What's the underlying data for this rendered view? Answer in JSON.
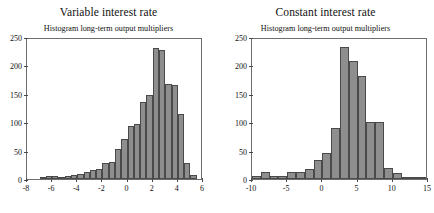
{
  "figure": {
    "width": 434,
    "height": 213,
    "background": "#ffffff",
    "bar_fill": "#8e8e8e",
    "bar_edge": "#4a4a4a",
    "axis_color": "#6e6e6e"
  },
  "panels": [
    {
      "id": "variable-interest-rate",
      "title": "Variable interest rate",
      "subtitle": "Histogram long-term output multipliers"
    },
    {
      "id": "constant-interest-rate",
      "title": "Constant interest rate",
      "subtitle": "Histogram long-term output multipliers"
    }
  ],
  "chart_data": [
    {
      "type": "bar",
      "id": "variable-interest-rate",
      "title": "Variable interest rate",
      "subtitle": "Histogram long-term output multipliers",
      "xlabel": "",
      "ylabel": "",
      "xlim": [
        -8,
        6
      ],
      "ylim": [
        0,
        250
      ],
      "xticks": [
        -8,
        -6,
        -4,
        -2,
        0,
        2,
        4,
        6
      ],
      "yticks": [
        0,
        50,
        100,
        150,
        200,
        250
      ],
      "xtick_labels": [
        "-8",
        "-6",
        "-4",
        "-2",
        "0",
        "2",
        "4",
        "6"
      ],
      "ytick_labels": [
        "0",
        "50",
        "100",
        "150",
        "200",
        "250"
      ],
      "grid": false,
      "legend": "none",
      "bin_width": 0.5,
      "bin_edges": [
        -7.0,
        -6.5,
        -6.0,
        -5.5,
        -5.0,
        -4.5,
        -4.0,
        -3.5,
        -3.0,
        -2.5,
        -2.0,
        -1.5,
        -1.0,
        -0.5,
        0.0,
        0.5,
        1.0,
        1.5,
        2.0,
        2.5,
        3.0,
        3.5,
        4.0,
        4.5,
        5.0,
        5.5
      ],
      "bin_centers": [
        -6.75,
        -6.25,
        -5.75,
        -5.25,
        -4.75,
        -4.25,
        -3.75,
        -3.25,
        -2.75,
        -2.25,
        -1.75,
        -1.25,
        -0.75,
        -0.25,
        0.25,
        0.75,
        1.25,
        1.75,
        2.25,
        2.75,
        3.25,
        3.75,
        4.25,
        4.75,
        5.25
      ],
      "values": [
        2,
        6,
        5,
        4,
        6,
        7,
        8,
        13,
        16,
        18,
        28,
        30,
        52,
        70,
        94,
        96,
        136,
        148,
        230,
        228,
        167,
        166,
        114,
        29,
        7
      ],
      "bars": [
        {
          "x0": -7.0,
          "x1": -6.5,
          "height": 2
        },
        {
          "x0": -6.5,
          "x1": -6.0,
          "height": 6
        },
        {
          "x0": -6.0,
          "x1": -5.5,
          "height": 5
        },
        {
          "x0": -5.5,
          "x1": -5.0,
          "height": 4
        },
        {
          "x0": -5.0,
          "x1": -4.5,
          "height": 6
        },
        {
          "x0": -4.5,
          "x1": -4.0,
          "height": 7
        },
        {
          "x0": -4.0,
          "x1": -3.5,
          "height": 8
        },
        {
          "x0": -3.5,
          "x1": -3.0,
          "height": 13
        },
        {
          "x0": -3.0,
          "x1": -2.5,
          "height": 16
        },
        {
          "x0": -2.5,
          "x1": -2.0,
          "height": 18
        },
        {
          "x0": -2.0,
          "x1": -1.5,
          "height": 28
        },
        {
          "x0": -1.5,
          "x1": -1.0,
          "height": 30
        },
        {
          "x0": -1.0,
          "x1": -0.5,
          "height": 52
        },
        {
          "x0": -0.5,
          "x1": 0.0,
          "height": 70
        },
        {
          "x0": 0.0,
          "x1": 0.5,
          "height": 94
        },
        {
          "x0": 0.5,
          "x1": 1.0,
          "height": 96
        },
        {
          "x0": 1.0,
          "x1": 1.5,
          "height": 136
        },
        {
          "x0": 1.5,
          "x1": 2.0,
          "height": 148
        },
        {
          "x0": 2.0,
          "x1": 2.5,
          "height": 230
        },
        {
          "x0": 2.5,
          "x1": 3.0,
          "height": 228
        },
        {
          "x0": 3.0,
          "x1": 3.5,
          "height": 167
        },
        {
          "x0": 3.5,
          "x1": 4.0,
          "height": 166
        },
        {
          "x0": 4.0,
          "x1": 4.5,
          "height": 114
        },
        {
          "x0": 4.5,
          "x1": 5.0,
          "height": 29
        },
        {
          "x0": 5.0,
          "x1": 5.5,
          "height": 7
        }
      ]
    },
    {
      "type": "bar",
      "id": "constant-interest-rate",
      "title": "Constant interest rate",
      "subtitle": "Histogram long-term output multipliers",
      "xlabel": "",
      "ylabel": "",
      "xlim": [
        -10,
        15
      ],
      "ylim": [
        0,
        250
      ],
      "xticks": [
        -10,
        -5,
        0,
        5,
        10,
        15
      ],
      "yticks": [
        0,
        50,
        100,
        150,
        200,
        250
      ],
      "xtick_labels": [
        "-10",
        "-5",
        "0",
        "5",
        "10",
        "15"
      ],
      "ytick_labels": [
        "0",
        "50",
        "100",
        "150",
        "200",
        "250"
      ],
      "grid": false,
      "legend": "none",
      "bin_width": 1.25,
      "bin_edges": [
        -10.0,
        -8.75,
        -7.5,
        -6.25,
        -5.0,
        -3.75,
        -2.5,
        -1.25,
        0.0,
        1.25,
        2.5,
        3.75,
        5.0,
        6.25,
        7.5,
        8.75,
        10.0,
        11.25,
        12.5,
        13.75,
        15.0
      ],
      "bin_centers": [
        -9.375,
        -8.125,
        -6.875,
        -5.625,
        -4.375,
        -3.125,
        -1.875,
        -0.625,
        0.625,
        1.875,
        3.125,
        4.375,
        5.625,
        6.875,
        8.125,
        9.375,
        10.625,
        11.875,
        13.125,
        14.375
      ],
      "values": [
        5,
        13,
        5,
        6,
        12,
        12,
        17,
        33,
        46,
        89,
        233,
        207,
        181,
        100,
        100,
        19,
        10,
        3,
        1,
        1
      ],
      "bars": [
        {
          "x0": -10.0,
          "x1": -8.75,
          "height": 5
        },
        {
          "x0": -8.75,
          "x1": -7.5,
          "height": 13
        },
        {
          "x0": -7.5,
          "x1": -6.25,
          "height": 5
        },
        {
          "x0": -6.25,
          "x1": -5.0,
          "height": 6
        },
        {
          "x0": -5.0,
          "x1": -3.75,
          "height": 12
        },
        {
          "x0": -3.75,
          "x1": -2.5,
          "height": 12
        },
        {
          "x0": -2.5,
          "x1": -1.25,
          "height": 17
        },
        {
          "x0": -1.25,
          "x1": 0.0,
          "height": 33
        },
        {
          "x0": 0.0,
          "x1": 1.25,
          "height": 46
        },
        {
          "x0": 1.25,
          "x1": 2.5,
          "height": 89
        },
        {
          "x0": 2.5,
          "x1": 3.75,
          "height": 233
        },
        {
          "x0": 3.75,
          "x1": 5.0,
          "height": 207
        },
        {
          "x0": 5.0,
          "x1": 6.25,
          "height": 181
        },
        {
          "x0": 6.25,
          "x1": 7.5,
          "height": 100
        },
        {
          "x0": 7.5,
          "x1": 8.75,
          "height": 100
        },
        {
          "x0": 8.75,
          "x1": 10.0,
          "height": 19
        },
        {
          "x0": 10.0,
          "x1": 11.25,
          "height": 10
        },
        {
          "x0": 11.25,
          "x1": 12.5,
          "height": 3
        },
        {
          "x0": 12.5,
          "x1": 13.75,
          "height": 1
        },
        {
          "x0": 13.75,
          "x1": 15.0,
          "height": 1
        }
      ]
    }
  ]
}
